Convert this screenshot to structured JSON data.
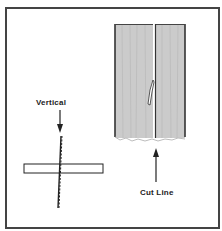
{
  "figure": {
    "labels": {
      "vertical": "Vertical",
      "cut_line": "Cut Line"
    },
    "panel": {
      "fill": "#c9c9c9",
      "edge": "#333333"
    }
  }
}
